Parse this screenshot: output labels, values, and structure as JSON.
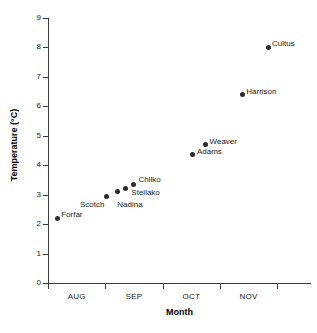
{
  "chart_data": {
    "type": "scatter",
    "title": "",
    "xlabel": "Month",
    "ylabel": "Temperature (°C)",
    "ylim": [
      0,
      9
    ],
    "yticks": [
      0,
      1,
      2,
      3,
      4,
      5,
      6,
      7,
      8,
      9
    ],
    "ytick_labels": [
      "0",
      "1",
      "2",
      "3",
      "4",
      "5",
      "6",
      "7",
      "8",
      "9"
    ],
    "xtick_labels": [
      "AUG",
      "SEP",
      "OCT",
      "NOV"
    ],
    "x_axis_type": "month-categorical",
    "grid": false,
    "legend": null,
    "marker": "filled-circle",
    "marker_color": "#2b2b2b",
    "points": [
      {
        "label": "Forfar",
        "x_month": "AUG",
        "x_frac": 0.16,
        "y": 2.2
      },
      {
        "label": "Scotch",
        "x_month": "SEP",
        "x_frac": 1.02,
        "y": 2.95
      },
      {
        "label": "Nadina",
        "x_month": "SEP",
        "x_frac": 1.21,
        "y": 3.1
      },
      {
        "label": "Stellako",
        "x_month": "SEP",
        "x_frac": 1.35,
        "y": 3.2
      },
      {
        "label": "Chilko",
        "x_month": "SEP",
        "x_frac": 1.49,
        "y": 3.35
      },
      {
        "label": "Adams",
        "x_month": "OCT",
        "x_frac": 2.53,
        "y": 4.35
      },
      {
        "label": "Weaver",
        "x_month": "OCT",
        "x_frac": 2.75,
        "y": 4.7
      },
      {
        "label": "Harrison",
        "x_month": "NOV",
        "x_frac": 3.39,
        "y": 6.4
      },
      {
        "label": "Cultus",
        "x_month": "NOV",
        "x_frac": 3.84,
        "y": 8.0
      }
    ]
  },
  "axes": {
    "y_title": "Temperature (°C)",
    "x_title": "Month",
    "y_ticks": [
      "9",
      "8",
      "7",
      "6",
      "5",
      "4",
      "3",
      "2",
      "1",
      "0"
    ],
    "x_ticks": [
      "AUG",
      "SEP",
      "OCT",
      "NOV"
    ]
  }
}
